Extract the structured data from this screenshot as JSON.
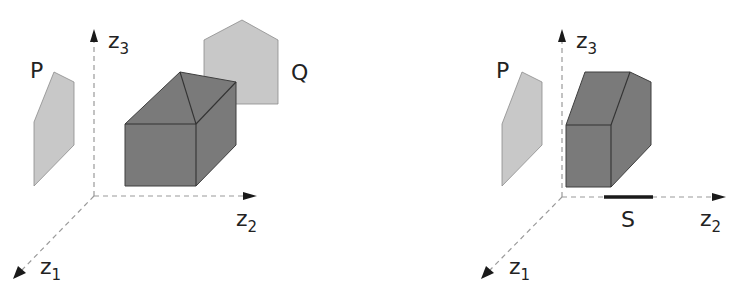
{
  "figure": {
    "left_panel": {
      "axes": {
        "z1": "z",
        "z1_sub": "1",
        "z2": "z",
        "z2_sub": "2",
        "z3": "z",
        "z3_sub": "3"
      },
      "labels": {
        "P": "P",
        "Q": "Q"
      },
      "objects": [
        "P (light gray projection polygon on z1-z3 plane)",
        "house-shaped solid (dark gray)",
        "Q (light gray pentagon projection)"
      ]
    },
    "right_panel": {
      "axes": {
        "z1": "z",
        "z1_sub": "1",
        "z2": "z",
        "z2_sub": "2",
        "z3": "z",
        "z3_sub": "3"
      },
      "labels": {
        "P": "P",
        "S": "S"
      },
      "objects": [
        "P (light gray projection polygon)",
        "prism solid (dark gray)",
        "S (thick segment on z2 axis)"
      ]
    },
    "colors": {
      "light_fill": "#c8c8c8",
      "dark_fill": "#7a7a7a",
      "axis": "#9a9a9a",
      "text": "#222222"
    }
  }
}
